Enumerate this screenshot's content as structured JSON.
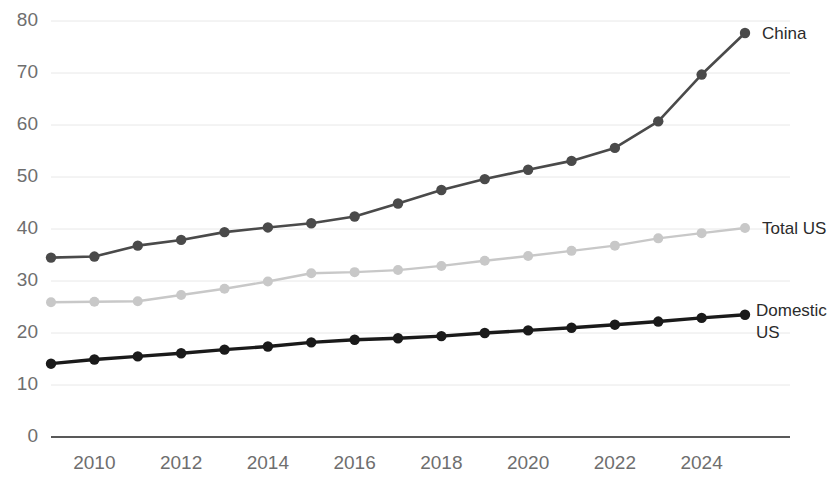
{
  "chart_data": {
    "type": "line",
    "title": "",
    "subtitle": "",
    "xlabel": "",
    "ylabel": "",
    "x": [
      2009,
      2010,
      2011,
      2012,
      2013,
      2014,
      2015,
      2016,
      2017,
      2018,
      2019,
      2020,
      2021,
      2022,
      2023,
      2024,
      2025
    ],
    "xlim": [
      2009,
      2025
    ],
    "ylim": [
      0,
      80
    ],
    "yticks": [
      0,
      10,
      20,
      30,
      40,
      50,
      60,
      70,
      80
    ],
    "xticks": [
      2010,
      2012,
      2014,
      2016,
      2018,
      2020,
      2022,
      2024
    ],
    "grid": true,
    "legend_position": "line-end-labels",
    "series": [
      {
        "name": "China",
        "color": "#4a4a4a",
        "label": "China",
        "values": [
          34.5,
          34.7,
          36.8,
          37.9,
          39.4,
          40.3,
          41.1,
          42.4,
          44.9,
          47.5,
          49.6,
          51.4,
          53.1,
          55.6,
          60.7,
          69.7,
          77.7
        ]
      },
      {
        "name": "Total US",
        "color": "#c8c8c8",
        "label": "Total US",
        "values": [
          25.9,
          26.0,
          26.1,
          27.3,
          28.5,
          29.9,
          31.5,
          31.7,
          32.1,
          32.9,
          33.9,
          34.8,
          35.8,
          36.8,
          38.2,
          39.2,
          40.2
        ]
      },
      {
        "name": "Domestic US",
        "color": "#1a1a1a",
        "label": "Domestic US",
        "values": [
          14.1,
          14.9,
          15.5,
          16.1,
          16.8,
          17.4,
          18.2,
          18.7,
          19.0,
          19.4,
          20.0,
          20.5,
          21.0,
          21.6,
          22.2,
          22.9,
          23.5
        ]
      }
    ]
  },
  "axis": {
    "y_tick_labels": [
      "0",
      "10",
      "20",
      "30",
      "40",
      "50",
      "60",
      "70",
      "80"
    ],
    "x_tick_labels": [
      "2010",
      "2012",
      "2014",
      "2016",
      "2018",
      "2020",
      "2022",
      "2024"
    ]
  },
  "labels": {
    "china": "China",
    "total_us": "Total US",
    "domestic_us_line1": "Domestic",
    "domestic_us_line2": "US"
  }
}
